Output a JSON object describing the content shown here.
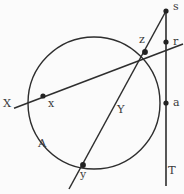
{
  "figure": {
    "type": "geometry-diagram",
    "canvas": {
      "width": 184,
      "height": 194
    },
    "background_color": "#fbfbfb",
    "stroke_color": "#2e2e2e",
    "label_color": "#3a3a3a",
    "circle": {
      "cx": 94,
      "cy": 103,
      "r": 66,
      "label": "A"
    },
    "points": [
      {
        "id": "s",
        "label": "s",
        "x": 166,
        "y": 11,
        "label_x": 174,
        "label_y": 2,
        "dot": true
      },
      {
        "id": "r",
        "label": "r",
        "x": 166,
        "y": 42,
        "label_x": 174,
        "label_y": 36,
        "dot": true
      },
      {
        "id": "z",
        "label": "z",
        "x": 145,
        "y": 52,
        "label_x": 140,
        "label_y": 35,
        "dot": true
      },
      {
        "id": "a",
        "label": "a",
        "x": 166,
        "y": 103,
        "label_x": 174,
        "label_y": 97,
        "dot": true
      },
      {
        "id": "x",
        "label": "x",
        "x": 43,
        "y": 96,
        "label_x": 48,
        "label_y": 98,
        "dot": true
      },
      {
        "id": "y",
        "label": "y",
        "x": 83,
        "y": 165,
        "label_x": 81,
        "label_y": 170,
        "dot": true
      }
    ],
    "lines": [
      {
        "id": "secant-X",
        "label": "X",
        "label_x": 4,
        "label_y": 98,
        "x1": 14,
        "y1": 108,
        "x2": 182,
        "y2": 44
      },
      {
        "id": "secant-Y",
        "label": "Y",
        "label_x": 118,
        "label_y": 104,
        "x1": 166,
        "y1": 11,
        "x2": 70,
        "y2": 188
      },
      {
        "id": "tangent-T",
        "label": "T",
        "label_x": 169,
        "label_y": 166,
        "x1": 166,
        "y1": 11,
        "x2": 166,
        "y2": 186
      }
    ],
    "region_label": {
      "label": "A",
      "x": 40,
      "y": 139
    }
  }
}
